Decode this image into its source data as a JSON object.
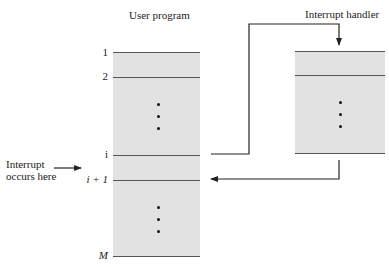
{
  "user_program": {
    "title": "User program",
    "markers": {
      "line1": "1",
      "line2": "2",
      "line_i": "i",
      "line_i_plus_1": "i + 1",
      "line_M": "M"
    }
  },
  "interrupt_handler": {
    "title": "Interrupt handler"
  },
  "interrupt_note": {
    "line1": "Interrupt",
    "line2": "occurs here"
  },
  "colors": {
    "box_fill": "#e2e2e2",
    "line": "#555555",
    "arrow": "#222222"
  }
}
